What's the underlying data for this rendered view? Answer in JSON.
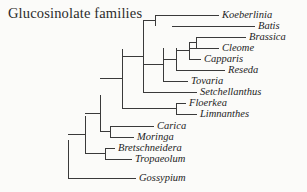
{
  "figure": {
    "title": "Glucosinolate families",
    "width": 307,
    "height": 192,
    "background_color": "#fbfbf9",
    "line_color": "#3a3a3a",
    "text_color": "#232323"
  },
  "chart_data": {
    "type": "diagram",
    "diagram_type": "cladogram",
    "title": "Glucosinolate families",
    "orientation": "left-to-right",
    "taxa_count": 15,
    "taxa": [
      {
        "name": "Koeberlinia",
        "row": 0,
        "tip_y": 15,
        "branch_start_x": 155,
        "label_x": 222
      },
      {
        "name": "Batis",
        "row": 1,
        "tip_y": 26,
        "branch_start_x": 172,
        "label_x": 258
      },
      {
        "name": "Brassica",
        "row": 2,
        "tip_y": 37,
        "branch_start_x": 196,
        "label_x": 249
      },
      {
        "name": "Cleome",
        "row": 3,
        "tip_y": 48,
        "branch_start_x": 189,
        "label_x": 222
      },
      {
        "name": "Capparis",
        "row": 4,
        "tip_y": 59,
        "branch_start_x": 189,
        "label_x": 204
      },
      {
        "name": "Reseda",
        "row": 5,
        "tip_y": 70,
        "branch_start_x": 176,
        "label_x": 228
      },
      {
        "name": "Tovaria",
        "row": 6,
        "tip_y": 81,
        "branch_start_x": 163,
        "label_x": 191
      },
      {
        "name": "Setchellanthus",
        "row": 7,
        "tip_y": 92,
        "branch_start_x": 143,
        "label_x": 200
      },
      {
        "name": "Floerkea",
        "row": 8,
        "tip_y": 103,
        "branch_start_x": 176,
        "label_x": 189
      },
      {
        "name": "Limnanthes",
        "row": 9,
        "tip_y": 114,
        "branch_start_x": 176,
        "label_x": 200
      },
      {
        "name": "Carica",
        "row": 10,
        "tip_y": 126,
        "branch_start_x": 110,
        "label_x": 157
      },
      {
        "name": "Moringa",
        "row": 11,
        "tip_y": 137,
        "branch_start_x": 110,
        "label_x": 137
      },
      {
        "name": "Bretschneidera",
        "row": 12,
        "tip_y": 148,
        "branch_start_x": 105,
        "label_x": 118
      },
      {
        "name": "Tropaeolum",
        "row": 13,
        "tip_y": 159,
        "branch_start_x": 105,
        "label_x": 135
      },
      {
        "name": "Gossypium",
        "row": 14,
        "tip_y": 178,
        "branch_start_x": 68,
        "label_x": 139
      }
    ],
    "nodes": [
      {
        "id": "root",
        "x": 68,
        "y_top": 140,
        "y_bottom": 178,
        "children": [
          "n-core",
          "Gossypium"
        ]
      },
      {
        "id": "n-core",
        "x": 85,
        "y_top": 116,
        "y_bottom": 153,
        "children": [
          "n-upper",
          "n-bret-trop"
        ]
      },
      {
        "id": "n-bret-trop",
        "x": 105,
        "y_top": 148,
        "y_bottom": 159,
        "children": [
          "Bretschneidera",
          "Tropaeolum"
        ]
      },
      {
        "id": "n-upper",
        "x": 100,
        "y_top": 95,
        "y_bottom": 131,
        "children": [
          "n-glucos",
          "n-carica-moringa"
        ]
      },
      {
        "id": "n-carica-moringa",
        "x": 110,
        "y_top": 126,
        "y_bottom": 137,
        "children": [
          "Carica",
          "Moringa"
        ]
      },
      {
        "id": "n-glucos",
        "x": 122,
        "y_top": 49,
        "y_bottom": 108,
        "children": [
          "n-brass-clade",
          "n-limnanth"
        ]
      },
      {
        "id": "n-limnanth",
        "x": 176,
        "y_top": 103,
        "y_bottom": 114,
        "children": [
          "Floerkea",
          "Limnanthes"
        ]
      },
      {
        "id": "n-brass-clade",
        "x": 143,
        "y_top": 20,
        "y_bottom": 92,
        "children": [
          "n-koeb-batis",
          "n-capp-clade",
          "Setchellanthus"
        ]
      },
      {
        "id": "n-koeb-batis",
        "x": 155,
        "y_top": 15,
        "y_bottom": 26,
        "children": [
          "Koeberlinia",
          "Batis"
        ]
      },
      {
        "id": "n-capp-clade",
        "x": 163,
        "y_top": 48,
        "y_bottom": 81,
        "children": [
          "n-reseda-grp",
          "Tovaria"
        ]
      },
      {
        "id": "n-reseda-grp",
        "x": 176,
        "y_top": 48,
        "y_bottom": 70,
        "children": [
          "n-capparis-grp",
          "Reseda"
        ]
      },
      {
        "id": "n-capparis-grp",
        "x": 189,
        "y_top": 42,
        "y_bottom": 59,
        "children": [
          "n-brass-cleome",
          "Capparis"
        ]
      },
      {
        "id": "n-brass-cleome",
        "x": 196,
        "y_top": 37,
        "y_bottom": 48,
        "children": [
          "Brassica",
          "Cleome"
        ]
      }
    ]
  }
}
